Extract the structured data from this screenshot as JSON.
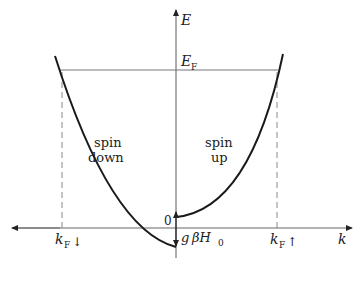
{
  "diagram": {
    "type": "band-energy-dispersion",
    "axes": {
      "y_label": "E",
      "x_label": "k"
    },
    "fermi_level": {
      "label": "E",
      "subscript": "F"
    },
    "origin_label": "0",
    "splitting_label": {
      "g": "g",
      "rest": "βH",
      "subscript": "0"
    },
    "regions": [
      {
        "line1": "spin",
        "line2": "down"
      },
      {
        "line1": "spin",
        "line2": "up"
      }
    ],
    "fermi_wavevectors": [
      {
        "label": "k",
        "subscript": "F",
        "arrow": "↓"
      },
      {
        "label": "k",
        "subscript": "F",
        "arrow": "↑"
      }
    ],
    "colors": {
      "curve": "#1a1a1a",
      "axis": "#555555",
      "dashed": "#777777"
    }
  }
}
